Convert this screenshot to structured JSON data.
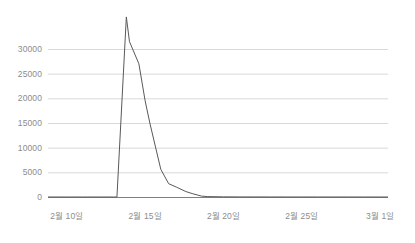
{
  "chart_data": {
    "type": "line",
    "title": "",
    "subtitle": "",
    "xlabel": "",
    "ylabel": "",
    "ylim": [
      0,
      36500
    ],
    "yticks": [
      0,
      5000,
      10000,
      15000,
      20000,
      25000,
      30000
    ],
    "ytick_labels": [
      "0",
      "5000",
      "10000",
      "15000",
      "20000",
      "25000",
      "30000"
    ],
    "xtick_labels": [
      "2월 10일",
      "2월 15일",
      "2월 20일",
      "2월 25일",
      "3월 1일"
    ],
    "xtick_positions": [
      0,
      5,
      10,
      15,
      20
    ],
    "xlim": [
      -1.2,
      20.5
    ],
    "grid": true,
    "grid_axis": "y",
    "legend": false,
    "legend_position": "none",
    "x": [
      -1.2,
      0,
      1,
      2,
      3,
      3.2,
      3.8,
      4,
      4.6,
      5,
      5.3,
      6,
      6.5,
      7,
      7.6,
      8,
      8.6,
      9,
      10,
      11,
      12,
      13,
      14,
      15,
      16,
      17,
      18,
      19,
      20,
      20.5
    ],
    "values": [
      0,
      0,
      0,
      0,
      0,
      0,
      36500,
      31500,
      27000,
      19500,
      15000,
      5600,
      2700,
      2000,
      1100,
      700,
      180,
      80,
      30,
      15,
      10,
      8,
      5,
      4,
      3,
      2,
      2,
      1,
      1,
      0
    ],
    "series": [
      {
        "name": "series-1",
        "color": "#595959",
        "values": [
          0,
          0,
          0,
          0,
          0,
          0,
          36500,
          31500,
          27000,
          19500,
          15000,
          5600,
          2700,
          2000,
          1100,
          700,
          180,
          80,
          30,
          15,
          10,
          8,
          5,
          4,
          3,
          2,
          2,
          1,
          1,
          0
        ]
      }
    ],
    "annotations": []
  },
  "colors": {
    "line": "#595959",
    "grid": "#d9d9d9",
    "axis": "#7f7f7f",
    "tick_text": "#8c8c8c",
    "background": "#ffffff",
    "border": "#e8e8e8"
  }
}
